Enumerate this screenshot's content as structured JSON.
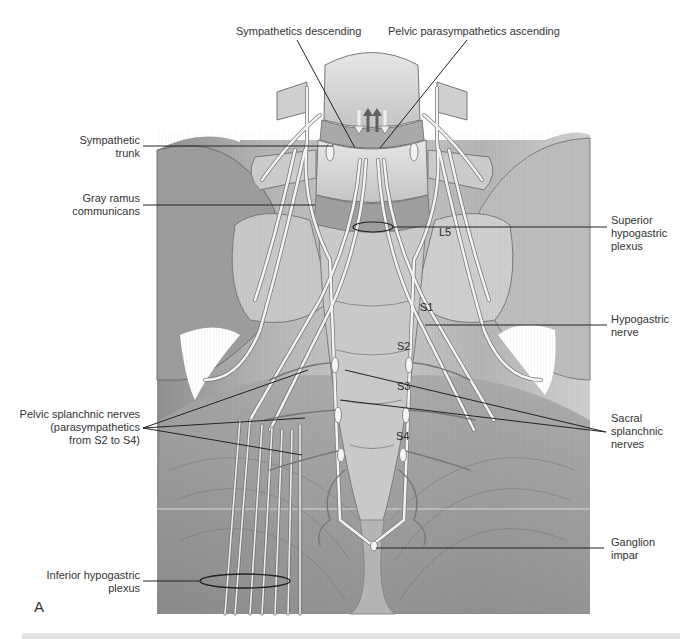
{
  "figure": {
    "panel_letter": "A",
    "style": "grayscale anatomical illustration",
    "colors": {
      "bone": "#d6d6d6",
      "muscle": "#9a9a9a",
      "nerve": "#f2f2f2",
      "leader": "#222222",
      "background": "#ffffff"
    }
  },
  "labels": {
    "top": [
      {
        "id": "sympathetics-descending",
        "text": "Sympathetics descending"
      },
      {
        "id": "pelvic-parasympathetics-ascending",
        "text": "Pelvic parasympathetics ascending"
      }
    ],
    "left": [
      {
        "id": "sympathetic-trunk",
        "lines": [
          "Sympathetic",
          "trunk"
        ]
      },
      {
        "id": "gray-ramus-communicans",
        "lines": [
          "Gray ramus",
          "communicans"
        ]
      },
      {
        "id": "pelvic-splanchnic-nerves",
        "lines": [
          "Pelvic splanchnic nerves",
          "(parasympathetics",
          "from S2 to S4)"
        ]
      },
      {
        "id": "inferior-hypogastric-plexus",
        "lines": [
          "Inferior hypogastric",
          "plexus"
        ]
      }
    ],
    "right": [
      {
        "id": "superior-hypogastric-plexus",
        "lines": [
          "Superior",
          "hypogastric",
          "plexus"
        ]
      },
      {
        "id": "hypogastric-nerve",
        "lines": [
          "Hypogastric",
          "nerve"
        ]
      },
      {
        "id": "sacral-splanchnic-nerves",
        "lines": [
          "Sacral",
          "splanchnic",
          "nerves"
        ]
      },
      {
        "id": "ganglion-impar",
        "lines": [
          "Ganglion",
          "impar"
        ]
      }
    ],
    "vertebrae": [
      "L5",
      "S1",
      "S2",
      "S3",
      "S4"
    ]
  }
}
